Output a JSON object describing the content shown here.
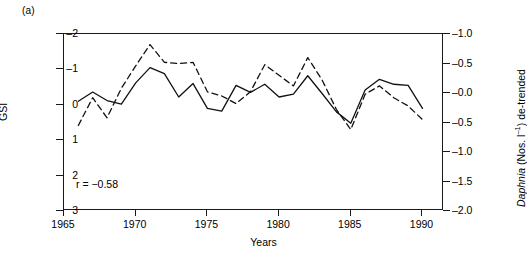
{
  "panel": {
    "label": "(a)"
  },
  "axes": {
    "x": {
      "title": "Years",
      "ticks": [
        "1965",
        "1970",
        "1975",
        "1980",
        "1985",
        "1990"
      ],
      "tick_values": [
        1965,
        1970,
        1975,
        1980,
        1985,
        1990
      ],
      "range": [
        1965,
        1991.5
      ]
    },
    "y_left": {
      "title": "GSI",
      "ticks": [
        "–2",
        "–1",
        "0",
        "1",
        "2",
        "3"
      ],
      "tick_values": [
        -2,
        -1,
        0,
        1,
        2,
        3
      ],
      "range": [
        -2,
        3
      ],
      "inverted": true
    },
    "y_right": {
      "title_italic": "Daphnia",
      "title_rest": " (Nos. l",
      "title_exp": "–1",
      "title_tail": ") de-trended",
      "ticks": [
        "–1.0",
        "–0.5",
        "–0.0",
        "–0.5",
        "–1.0",
        "–1.5",
        "–2.0"
      ],
      "tick_values": [
        -1.0,
        -0.5,
        0.0,
        0.5,
        1.0,
        1.5,
        2.0
      ],
      "range": [
        -1.0,
        2.0
      ],
      "inverted": true
    }
  },
  "annotations": [
    {
      "id": "correlation",
      "text": "r = −0.58"
    }
  ],
  "chart_data": {
    "type": "line",
    "title": "",
    "xlabel": "Years",
    "ylabel": "GSI",
    "ylabel_right": "Daphnia (Nos. l-1) de-trended",
    "xlim": [
      1965,
      1991.5
    ],
    "ylim_left": [
      -2,
      3
    ],
    "ylim_right": [
      -1.0,
      2.0
    ],
    "y_left_inverted": true,
    "y_right_inverted": true,
    "grid": false,
    "legend": "none",
    "x": [
      1966,
      1967,
      1968,
      1969,
      1970,
      1971,
      1972,
      1973,
      1974,
      1975,
      1976,
      1977,
      1978,
      1979,
      1980,
      1981,
      1982,
      1983,
      1984,
      1985,
      1986,
      1987,
      1988,
      1989,
      1990
    ],
    "series": [
      {
        "name": "GSI",
        "axis": "left",
        "style": "solid",
        "color": "#111111",
        "values": [
          -0.1,
          -0.36,
          -0.12,
          -0.02,
          -0.62,
          -1.05,
          -0.88,
          -0.22,
          -0.6,
          0.1,
          0.18,
          -0.55,
          -0.35,
          -0.58,
          -0.22,
          -0.3,
          -0.82,
          -0.32,
          0.2,
          0.52,
          -0.42,
          -0.72,
          -0.58,
          -0.55,
          0.1
        ]
      },
      {
        "name": "Daphnia de-trended",
        "axis": "right",
        "style": "dashed",
        "color": "#111111",
        "values": [
          0.55,
          0.08,
          0.42,
          -0.08,
          -0.46,
          -0.82,
          -0.52,
          -0.5,
          -0.52,
          -0.02,
          0.05,
          0.18,
          -0.02,
          -0.48,
          -0.3,
          -0.12,
          -0.6,
          -0.22,
          0.28,
          0.62,
          0.02,
          -0.12,
          0.08,
          0.22,
          0.45
        ]
      }
    ],
    "annotations": [
      {
        "text": "r = −0.58",
        "x": 1967.2,
        "y_left": 2.1
      }
    ]
  }
}
